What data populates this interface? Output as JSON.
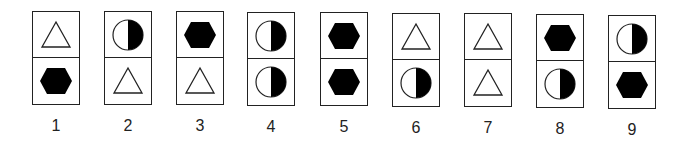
{
  "figure": {
    "type": "sequence-of-cards",
    "cards": [
      {
        "label": "1",
        "top": "triangle",
        "bottom": "hexagon"
      },
      {
        "label": "2",
        "top": "half-circle",
        "bottom": "triangle"
      },
      {
        "label": "3",
        "top": "hexagon",
        "bottom": "triangle"
      },
      {
        "label": "4",
        "top": "half-circle",
        "bottom": "half-circle"
      },
      {
        "label": "5",
        "top": "hexagon",
        "bottom": "hexagon"
      },
      {
        "label": "6",
        "top": "triangle",
        "bottom": "half-circle"
      },
      {
        "label": "7",
        "top": "triangle",
        "bottom": "triangle"
      },
      {
        "label": "8",
        "top": "hexagon",
        "bottom": "half-circle"
      },
      {
        "label": "9",
        "top": "half-circle",
        "bottom": "hexagon"
      }
    ],
    "positions": [
      {
        "x": 32,
        "y": 11
      },
      {
        "x": 104,
        "y": 11
      },
      {
        "x": 176,
        "y": 11
      },
      {
        "x": 247,
        "y": 12
      },
      {
        "x": 320,
        "y": 12
      },
      {
        "x": 392,
        "y": 13
      },
      {
        "x": 464,
        "y": 13
      },
      {
        "x": 536,
        "y": 14
      },
      {
        "x": 608,
        "y": 15
      }
    ],
    "colors": {
      "stroke": "#222222",
      "fill": "#000000",
      "background": "#ffffff"
    }
  }
}
